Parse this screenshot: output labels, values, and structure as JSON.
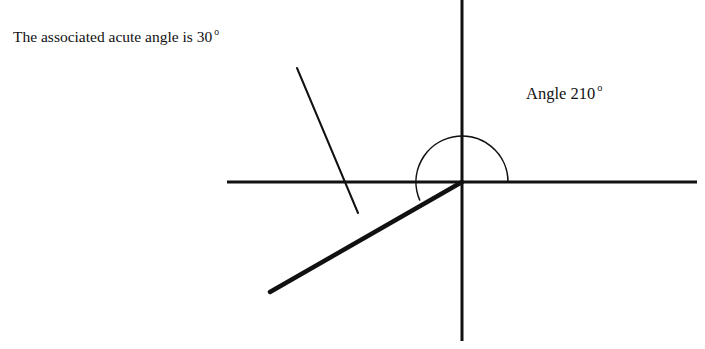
{
  "page": {
    "width": 705,
    "height": 349,
    "background_color": "#ffffff",
    "ink_color": "#111111"
  },
  "labels": {
    "acute_note": {
      "text": "The associated acute angle is 30",
      "degree_symbol": "o",
      "full_text": "The associated acute angle is 30°"
    },
    "angle_label": {
      "text": "Angle 210",
      "degree_symbol": "o",
      "full_text": "Angle 210°"
    }
  },
  "chart_data": {
    "type": "diagram",
    "origin": {
      "x": 462,
      "y": 182
    },
    "axes": {
      "x_axis": {
        "x1": 227,
        "y1": 182,
        "x2": 697,
        "y2": 182,
        "stroke_width": 3
      },
      "y_axis": {
        "x1": 462,
        "y1": 0,
        "x2": 462,
        "y2": 341,
        "stroke_width": 3
      }
    },
    "angle_value_degrees": 210,
    "reference_acute_angle_degrees": 30,
    "terminal_ray": {
      "from": {
        "x": 462,
        "y": 182
      },
      "to": {
        "x": 270,
        "y": 292
      },
      "stroke_width": 4.5,
      "direction_degrees": 210
    },
    "initial_ray_direction_degrees": 0,
    "arc": {
      "center": {
        "x": 462,
        "y": 182
      },
      "radius": 46,
      "start_angle_degrees": 0,
      "end_angle_degrees": 203,
      "sweep": "counterclockwise",
      "stroke_width": 1.6
    },
    "leader_line": {
      "from": {
        "x": 297,
        "y": 68
      },
      "to": {
        "x": 358,
        "y": 213
      },
      "stroke_width": 2
    }
  }
}
